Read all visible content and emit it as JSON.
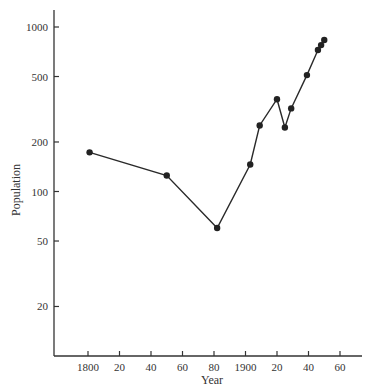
{
  "chart_data": {
    "type": "line",
    "title": "",
    "xlabel": "Year",
    "ylabel": "Population",
    "yscale": "log",
    "ylim": [
      10,
      1300
    ],
    "xlim": [
      1778,
      1973
    ],
    "grid": false,
    "legend": null,
    "x_ticks": [
      {
        "value": 1800,
        "label": "1800"
      },
      {
        "value": 1820,
        "label": "20"
      },
      {
        "value": 1840,
        "label": "40"
      },
      {
        "value": 1860,
        "label": "60"
      },
      {
        "value": 1880,
        "label": "80"
      },
      {
        "value": 1900,
        "label": "1900"
      },
      {
        "value": 1920,
        "label": "20"
      },
      {
        "value": 1940,
        "label": "40"
      },
      {
        "value": 1960,
        "label": "60"
      }
    ],
    "y_ticks": [
      {
        "value": 1000,
        "label": "1000"
      },
      {
        "value": 500,
        "label": "500"
      },
      {
        "value": 200,
        "label": "200"
      },
      {
        "value": 100,
        "label": "100"
      },
      {
        "value": 50,
        "label": "50"
      },
      {
        "value": 20,
        "label": "20"
      }
    ],
    "series": [
      {
        "name": "Population",
        "x": [
          1801,
          1850,
          1882,
          1903,
          1909,
          1920,
          1925,
          1929,
          1939,
          1946,
          1948,
          1950
        ],
        "values": [
          173,
          125,
          60,
          146,
          252,
          364,
          245,
          320,
          510,
          724,
          776,
          833
        ]
      }
    ]
  }
}
